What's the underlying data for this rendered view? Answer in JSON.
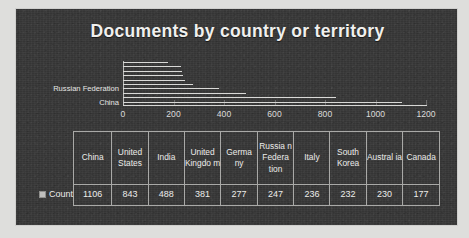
{
  "chart_data": {
    "type": "bar",
    "orientation": "horizontal",
    "title": "Documents by country or territory",
    "xlabel": "",
    "ylabel": "",
    "xlim": [
      0,
      1200
    ],
    "xticks": [
      0,
      200,
      400,
      600,
      800,
      1000,
      1200
    ],
    "grid": false,
    "legend": {
      "position": "table-left",
      "marker": "count-legend-swatch",
      "label": "Count"
    },
    "visible_y_tick_labels": [
      "Russian Federation",
      "China"
    ],
    "categories": [
      "China",
      "United States",
      "India",
      "United Kingdom",
      "Germany",
      "Russian Federation",
      "Italy",
      "South Korea",
      "Australia",
      "Canada"
    ],
    "values": [
      1106,
      843,
      488,
      381,
      277,
      247,
      236,
      232,
      230,
      177
    ],
    "bar_order_top_to_bottom": [
      177,
      230,
      232,
      236,
      247,
      277,
      381,
      488,
      843,
      1106
    ],
    "series": [
      {
        "name": "Count",
        "values": [
          1106,
          843,
          488,
          381,
          277,
          247,
          236,
          232,
          230,
          177
        ]
      }
    ]
  },
  "table": {
    "row_label": "Count",
    "headers": [
      "China",
      "United States",
      "India",
      "United Kingdo m",
      "Germa ny",
      "Russia n Federa tion",
      "Italy",
      "South Korea",
      "Austral ia",
      "Canada"
    ],
    "values": [
      "1106",
      "843",
      "488",
      "381",
      "277",
      "247",
      "236",
      "232",
      "230",
      "177"
    ]
  },
  "colors": {
    "canvas_background": "#373737",
    "bar": "#d9d9d7",
    "text": "#ececea",
    "grid_line": "#a9a9a7",
    "page_background": "#dededc"
  }
}
